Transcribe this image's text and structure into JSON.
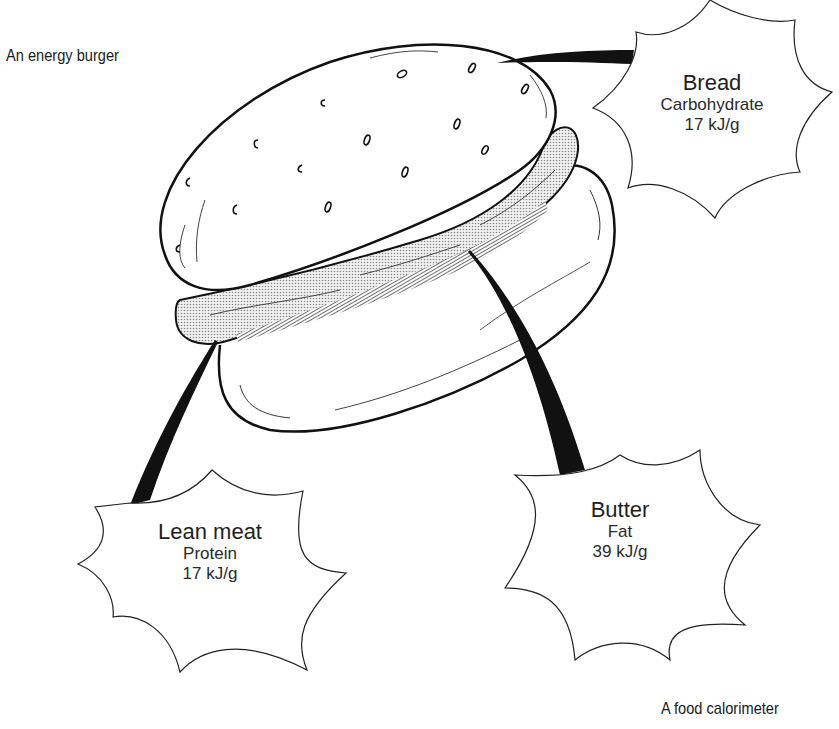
{
  "captions": {
    "top_left": "An energy burger",
    "bottom_right": "A food calorimeter"
  },
  "labels": {
    "bread": {
      "name": "Bread",
      "nutrient": "Carbohydrate",
      "energy": "17 kJ/g"
    },
    "lean_meat": {
      "name": "Lean meat",
      "nutrient": "Protein",
      "energy": "17 kJ/g"
    },
    "butter": {
      "name": "Butter",
      "nutrient": "Fat",
      "energy": "39 kJ/g"
    }
  },
  "colors": {
    "ink": "#1a1a1a",
    "patty_fill": "#d9d9d9",
    "background": "#ffffff"
  }
}
